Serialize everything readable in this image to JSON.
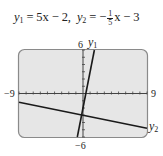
{
  "title": {
    "eq1_lhs": "y",
    "eq1_sub": "1",
    "eq1_rhs": " = 5x − 2,",
    "eq2_lhs": "y",
    "eq2_sub": "2",
    "eq2_mid": " = −",
    "eq2_num": "1",
    "eq2_den": "5",
    "eq2_rhs": "x − 3"
  },
  "window": {
    "xmin_label": "−9",
    "xmax_label": "9",
    "ymin_label": "−6",
    "ymax_label": "6"
  },
  "curve_labels": {
    "y1": "y",
    "y1_sub": "1",
    "y2": "y",
    "y2_sub": "2"
  },
  "colors": {
    "screen_bg": "#e6e6e6",
    "frame": "#8a8a8a",
    "line": "#1a1a1a",
    "axis": "#444444"
  },
  "chart_data": {
    "type": "line",
    "xlabel": "",
    "ylabel": "",
    "xlim": [
      -9,
      9
    ],
    "ylim": [
      -6,
      6
    ],
    "xscale": 1,
    "yscale": 1,
    "grid": false,
    "series": [
      {
        "name": "y1",
        "equation": "y = 5x - 2",
        "x": [
          -0.8,
          1.6
        ],
        "y": [
          -6,
          6
        ]
      },
      {
        "name": "y2",
        "equation": "y = -(1/5)x - 3",
        "x": [
          -9,
          9
        ],
        "y": [
          -1.2,
          -4.8
        ]
      }
    ],
    "annotations": [
      "y1",
      "y2",
      "−9",
      "9",
      "6",
      "−6"
    ]
  }
}
